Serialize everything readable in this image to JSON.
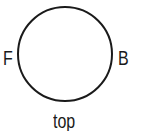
{
  "diagram": {
    "shape": "circle",
    "circle": {
      "cx": 65,
      "cy": 54,
      "r": 47,
      "stroke": "#1a1a1a",
      "fill": "#ffffff"
    },
    "labels": {
      "left": "F",
      "right": "B",
      "bottom": "top"
    }
  }
}
